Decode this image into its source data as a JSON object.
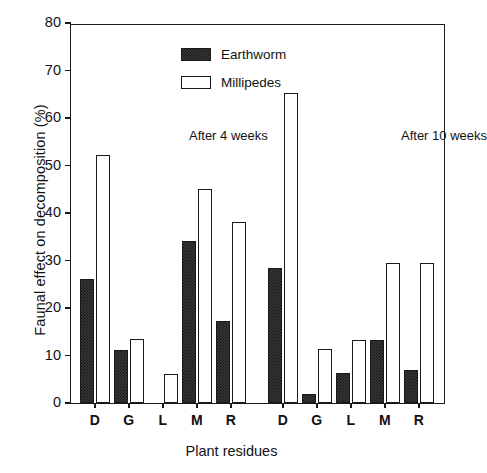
{
  "chart_data": {
    "type": "bar",
    "title": "",
    "xlabel": "Plant residues",
    "ylabel": "Faunal effect on decomposition (%)",
    "ylim": [
      0,
      80
    ],
    "ytick_step": 10,
    "yticks": [
      0,
      10,
      20,
      30,
      40,
      50,
      60,
      70,
      80
    ],
    "grid": false,
    "legend_position": "top-left-inside",
    "categories": [
      "D",
      "G",
      "L",
      "M",
      "R",
      "D",
      "G",
      "L",
      "M",
      "R"
    ],
    "panels": [
      {
        "note": "After 4 weeks",
        "categories": [
          "D",
          "G",
          "L",
          "M",
          "R"
        ],
        "series": [
          {
            "name": "Earthworm",
            "values": [
              26.1,
              11.1,
              0,
              34.2,
              17.2
            ]
          },
          {
            "name": "Millipedes",
            "values": [
              52.2,
              13.5,
              6.2,
              45.0,
              38.2
            ]
          }
        ]
      },
      {
        "note": "After 10 weeks",
        "categories": [
          "D",
          "G",
          "L",
          "M",
          "R"
        ],
        "series": [
          {
            "name": "Earthworm",
            "values": [
              28.5,
              2.0,
              6.3,
              13.2,
              7.0
            ]
          },
          {
            "name": "Millipedes",
            "values": [
              65.2,
              11.3,
              13.3,
              29.5,
              29.4
            ]
          }
        ]
      }
    ],
    "series": [
      {
        "name": "Earthworm",
        "values": [
          26.1,
          11.1,
          0,
          34.2,
          17.2,
          28.5,
          2.0,
          6.3,
          13.2,
          7.0
        ]
      },
      {
        "name": "Millipedes",
        "values": [
          52.2,
          13.5,
          6.2,
          45.0,
          38.2,
          65.2,
          11.3,
          13.3,
          29.5,
          29.4
        ]
      }
    ],
    "annotations": [
      "After 4 weeks",
      "After 10 weeks"
    ],
    "colors": {
      "earthworm": "#2b2b2b",
      "millipedes": "#ffffff",
      "axis": "#1a1a1a"
    }
  },
  "legend": {
    "items": [
      {
        "label": "Earthworm",
        "style": "earthworm"
      },
      {
        "label": "Millipedes",
        "style": "millipedes"
      }
    ]
  }
}
